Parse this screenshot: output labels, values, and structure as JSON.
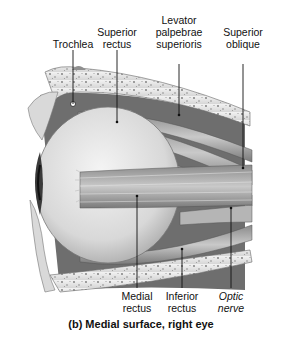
{
  "figure": {
    "caption": "(b) Medial surface, right eye",
    "labels": {
      "trochlea": "Trochlea",
      "superior_rectus": [
        "Superior",
        "rectus"
      ],
      "levator": [
        "Levator",
        "palpebrae",
        "superioris"
      ],
      "superior_oblique": [
        "Superior",
        "oblique"
      ],
      "medial_rectus": [
        "Medial",
        "rectus"
      ],
      "inferior_rectus": [
        "Inferior",
        "rectus"
      ],
      "optic_nerve": [
        "Optic",
        "nerve"
      ]
    }
  }
}
